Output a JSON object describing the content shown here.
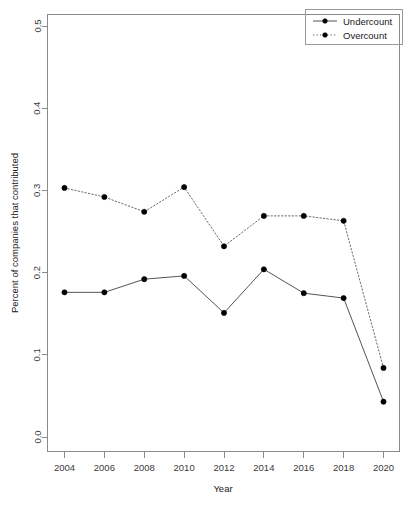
{
  "chart_data": {
    "type": "line",
    "title": "",
    "xlabel": "Year",
    "ylabel": "Percent of companies that contributed",
    "x": [
      2004,
      2006,
      2008,
      2010,
      2012,
      2014,
      2016,
      2018,
      2020
    ],
    "xtick_labels": [
      "2004",
      "2006",
      "2008",
      "2010",
      "2012",
      "2014",
      "2016",
      "2018",
      "2020"
    ],
    "ytick_labels": [
      "0.0",
      "0.1",
      "0.2",
      "0.3",
      "0.4",
      "0.5"
    ],
    "yticks": [
      0.0,
      0.1,
      0.2,
      0.3,
      0.4,
      0.5
    ],
    "xlim": [
      2003,
      2021
    ],
    "ylim": [
      0.0,
      0.5
    ],
    "grid": false,
    "legend_position": "top-right",
    "series": [
      {
        "name": "Undercount",
        "style": "solid",
        "marker": "filled-circle",
        "color": "#000000",
        "values": [
          0.176,
          0.176,
          0.192,
          0.196,
          0.151,
          0.204,
          0.175,
          0.169,
          0.043
        ]
      },
      {
        "name": "Overcount",
        "style": "dotted",
        "marker": "filled-circle",
        "color": "#000000",
        "values": [
          0.303,
          0.292,
          0.274,
          0.304,
          0.232,
          0.269,
          0.269,
          0.263,
          0.084
        ]
      }
    ]
  },
  "legend": {
    "entries": [
      {
        "label": "Undercount"
      },
      {
        "label": "Overcount"
      }
    ]
  },
  "axes": {
    "x_title": "Year",
    "y_title": "Percent of companies that contributed"
  }
}
